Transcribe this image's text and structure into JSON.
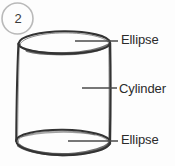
{
  "figure": {
    "number_badge": "2",
    "shape_name": "cylinder",
    "ink_color": "#333333",
    "badge_outline_color": "#b9b9b9",
    "leader_line_color": "#4a4a4a",
    "background_color": "#fdfdfd",
    "parts": [
      {
        "id": "top-ellipse",
        "label": "Ellipse",
        "leader_from": {
          "x": 75,
          "y": 41
        },
        "leader_to": {
          "x": 118,
          "y": 41
        }
      },
      {
        "id": "cylinder-body",
        "label": "Cylinder",
        "leader_from": {
          "x": 82,
          "y": 88
        },
        "leader_to": {
          "x": 117,
          "y": 88
        }
      },
      {
        "id": "bottom-ellipse",
        "label": "Ellipse",
        "leader_from": {
          "x": 68,
          "y": 141
        },
        "leader_to": {
          "x": 118,
          "y": 141
        }
      }
    ],
    "geometry": {
      "top_ellipse": {
        "cx": 64,
        "cy": 42,
        "rx": 46,
        "ry": 11
      },
      "bottom_ellipse": {
        "cx": 63,
        "cy": 142,
        "rx": 47,
        "ry": 13
      },
      "left_side": {
        "x1": 18,
        "y1": 42,
        "x2": 16,
        "y2": 142
      },
      "right_side": {
        "x1": 110,
        "y1": 42,
        "x2": 110,
        "y2": 142
      }
    }
  }
}
